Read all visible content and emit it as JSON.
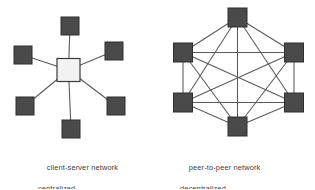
{
  "figure": {
    "title": "",
    "background_color": "#ffffff",
    "node_fill": "#4a4a4a",
    "node_stroke": "#2e2e2e",
    "server_fill": "#f2f2f2",
    "server_stroke": "#3a3a3a",
    "edge_color": "#5a5a5a",
    "text_color": "#3d3d3d"
  },
  "diagrams": [
    {
      "id": "client-server",
      "caption_line1": "client-server network",
      "caption_line2": "centralized",
      "topology": "star",
      "node_count": 7,
      "hub": {
        "label": "server",
        "x": 68.5,
        "y": 70,
        "size": 23,
        "fill": "#f2f2f2",
        "stroke": "#3a3a3a"
      },
      "nodes": [
        {
          "label": "client-top",
          "x": 70,
          "y": 26,
          "size": 18
        },
        {
          "label": "client-upper-left",
          "x": 23,
          "y": 55,
          "size": 18
        },
        {
          "label": "client-upper-right",
          "x": 114,
          "y": 51,
          "size": 18
        },
        {
          "label": "client-lower-left",
          "x": 25,
          "y": 106,
          "size": 18
        },
        {
          "label": "client-lower-right",
          "x": 116,
          "y": 106,
          "size": 18
        },
        {
          "label": "client-bottom",
          "x": 71,
          "y": 129,
          "size": 18
        }
      ],
      "edges": [
        [
          "hub",
          "client-top"
        ],
        [
          "hub",
          "client-upper-left"
        ],
        [
          "hub",
          "client-upper-right"
        ],
        [
          "hub",
          "client-lower-left"
        ],
        [
          "hub",
          "client-lower-right"
        ],
        [
          "hub",
          "client-bottom"
        ]
      ]
    },
    {
      "id": "peer-to-peer",
      "caption_line1": "peer-to-peer network",
      "caption_line2": "decentralized",
      "topology": "full-mesh",
      "node_count": 6,
      "nodes": [
        {
          "label": "peer-top",
          "x": 237.5,
          "y": 17.5,
          "size": 19
        },
        {
          "label": "peer-upper-left",
          "x": 183,
          "y": 52.5,
          "size": 19
        },
        {
          "label": "peer-upper-right",
          "x": 294,
          "y": 52.5,
          "size": 19
        },
        {
          "label": "peer-lower-left",
          "x": 183,
          "y": 102.5,
          "size": 19
        },
        {
          "label": "peer-lower-right",
          "x": 294,
          "y": 102.5,
          "size": 19
        },
        {
          "label": "peer-bottom",
          "x": 237.5,
          "y": 126.5,
          "size": 19
        }
      ],
      "edges": [
        [
          "peer-top",
          "peer-upper-left"
        ],
        [
          "peer-top",
          "peer-upper-right"
        ],
        [
          "peer-top",
          "peer-lower-left"
        ],
        [
          "peer-top",
          "peer-lower-right"
        ],
        [
          "peer-top",
          "peer-bottom"
        ],
        [
          "peer-upper-left",
          "peer-upper-right"
        ],
        [
          "peer-upper-left",
          "peer-lower-left"
        ],
        [
          "peer-upper-left",
          "peer-lower-right"
        ],
        [
          "peer-upper-left",
          "peer-bottom"
        ],
        [
          "peer-upper-right",
          "peer-lower-left"
        ],
        [
          "peer-upper-right",
          "peer-lower-right"
        ],
        [
          "peer-upper-right",
          "peer-bottom"
        ],
        [
          "peer-lower-left",
          "peer-lower-right"
        ],
        [
          "peer-lower-left",
          "peer-bottom"
        ],
        [
          "peer-lower-right",
          "peer-bottom"
        ]
      ]
    }
  ]
}
